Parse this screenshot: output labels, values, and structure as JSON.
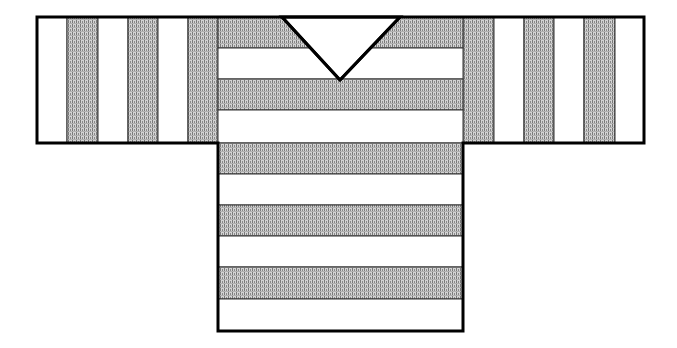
{
  "diagram": {
    "colors": {
      "outline": "#000000",
      "white_stripe": "#ffffff",
      "shaded_stripe": "#c8c8c8",
      "shade_dot": "#6e6e6e"
    },
    "sleeve_band": {
      "x": 37,
      "y": 17,
      "width": 607,
      "height": 126
    },
    "body": {
      "x": 218,
      "y": 17,
      "width": 245,
      "height": 314
    },
    "v_neck": {
      "left_x": 282,
      "right_x": 400,
      "top_y": 17,
      "point_x": 340,
      "point_y": 80
    },
    "left_sleeve_stripes": [
      {
        "x": 37,
        "w": 30,
        "shade": "white"
      },
      {
        "x": 67,
        "w": 31,
        "shade": "shaded"
      },
      {
        "x": 98,
        "w": 30,
        "shade": "white"
      },
      {
        "x": 128,
        "w": 30,
        "shade": "shaded"
      },
      {
        "x": 158,
        "w": 30,
        "shade": "white"
      },
      {
        "x": 188,
        "w": 30,
        "shade": "shaded"
      }
    ],
    "right_sleeve_stripes": [
      {
        "x": 463,
        "w": 31,
        "shade": "shaded"
      },
      {
        "x": 494,
        "w": 30,
        "shade": "white"
      },
      {
        "x": 524,
        "w": 30,
        "shade": "shaded"
      },
      {
        "x": 554,
        "w": 30,
        "shade": "white"
      },
      {
        "x": 584,
        "w": 31,
        "shade": "shaded"
      },
      {
        "x": 615,
        "w": 29,
        "shade": "white"
      }
    ],
    "body_stripes": [
      {
        "y": 17,
        "h": 31,
        "shade": "shaded"
      },
      {
        "y": 48,
        "h": 31,
        "shade": "white"
      },
      {
        "y": 79,
        "h": 31,
        "shade": "shaded"
      },
      {
        "y": 110,
        "h": 33,
        "shade": "white"
      },
      {
        "y": 143,
        "h": 31,
        "shade": "shaded"
      },
      {
        "y": 174,
        "h": 31,
        "shade": "white"
      },
      {
        "y": 205,
        "h": 31,
        "shade": "shaded"
      },
      {
        "y": 236,
        "h": 31,
        "shade": "white"
      },
      {
        "y": 267,
        "h": 32,
        "shade": "shaded"
      },
      {
        "y": 299,
        "h": 32,
        "shade": "white"
      }
    ]
  }
}
